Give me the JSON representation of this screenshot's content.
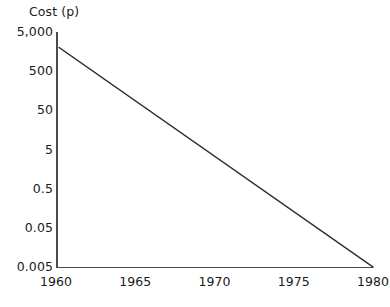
{
  "chart_data": {
    "type": "line",
    "title": "",
    "ylabel": "Cost (p)",
    "xlabel": "",
    "yscale": "log",
    "ytick_labels": [
      "5,000",
      "500",
      "50",
      "5",
      "0.5",
      "0.05",
      "0.005"
    ],
    "ytick_values": [
      5000,
      500,
      50,
      5,
      0.5,
      0.05,
      0.005
    ],
    "ylim": [
      0.005,
      5000
    ],
    "xtick_labels": [
      "1960",
      "1965",
      "1970",
      "1975",
      "1980"
    ],
    "xtick_values": [
      1960,
      1965,
      1970,
      1975,
      1980
    ],
    "xlim": [
      1960,
      1980
    ],
    "grid": false,
    "legend": null,
    "series": [
      {
        "name": "Cost",
        "x": [
          1960.2,
          1980.0
        ],
        "values": [
          2000,
          0.005
        ],
        "color": "#2b2b2b"
      }
    ],
    "annotations": []
  },
  "axes": {
    "y_axis_title": "Cost (p)",
    "axis_color": "#4a4a4a",
    "line_color": "#2b2b2b",
    "background": "#ffffff"
  },
  "geometry": {
    "plot_left": 56,
    "plot_right": 373,
    "plot_top": 32,
    "plot_bottom": 267,
    "line_start_x": 63,
    "line_start_y": 41,
    "line_end_x": 370,
    "line_end_y": 266
  }
}
